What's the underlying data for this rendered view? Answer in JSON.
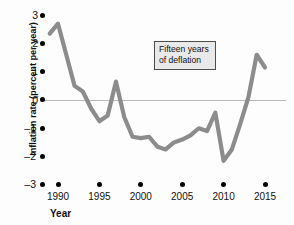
{
  "chart_data": {
    "type": "line",
    "title": "",
    "subtitle": "",
    "xlabel": "Year",
    "ylabel": "Inflation rate (percent per year)",
    "xlim": [
      1988.5,
      2016
    ],
    "ylim": [
      -3,
      3
    ],
    "grid": false,
    "zero_line": true,
    "legend": null,
    "xticks": [
      1990,
      1995,
      2000,
      2005,
      2010,
      2015
    ],
    "xtick_labels": [
      "1990",
      "1995",
      "2000",
      "2005",
      "2010",
      "2015"
    ],
    "yticks": [
      3,
      2,
      1,
      0,
      -1,
      -2,
      -3
    ],
    "ytick_labels": [
      "3",
      "2",
      "1",
      "0",
      "–1",
      "–2",
      "–3"
    ],
    "line_color": "#8c8c8c",
    "line_width": 4,
    "annotations": [
      {
        "name": "deflation-callout",
        "lines": [
          "Fifteen years",
          "of deflation"
        ],
        "text": "Fifteen years of deflation"
      }
    ],
    "x": [
      1989,
      1990,
      1991,
      1992,
      1993,
      1994,
      1995,
      1996,
      1997,
      1998,
      1999,
      2000,
      2001,
      2002,
      2003,
      2004,
      2005,
      2006,
      2007,
      2008,
      2009,
      2010,
      2011,
      2012,
      2013,
      2014,
      2015
    ],
    "values": [
      2.35,
      2.7,
      1.6,
      0.5,
      0.3,
      -0.3,
      -0.75,
      -0.55,
      0.65,
      -0.6,
      -1.3,
      -1.35,
      -1.3,
      -1.65,
      -1.75,
      -1.5,
      -1.4,
      -1.25,
      -1.0,
      -1.1,
      -0.45,
      -2.15,
      -1.75,
      -0.85,
      0.1,
      1.6,
      1.15
    ]
  },
  "axes": {
    "y_title": "Inflation rate (percent per year)",
    "x_title": "Year"
  },
  "annotation": {
    "line1": "Fifteen years",
    "line2": "of deflation"
  },
  "colors": {
    "line": "#8c8c8c",
    "zero_line": "#b8b8b8",
    "text": "#111111",
    "annotation_bg": "#e9e9e9",
    "annotation_border": "#4d4d4d",
    "background": "#fdfdfd"
  }
}
